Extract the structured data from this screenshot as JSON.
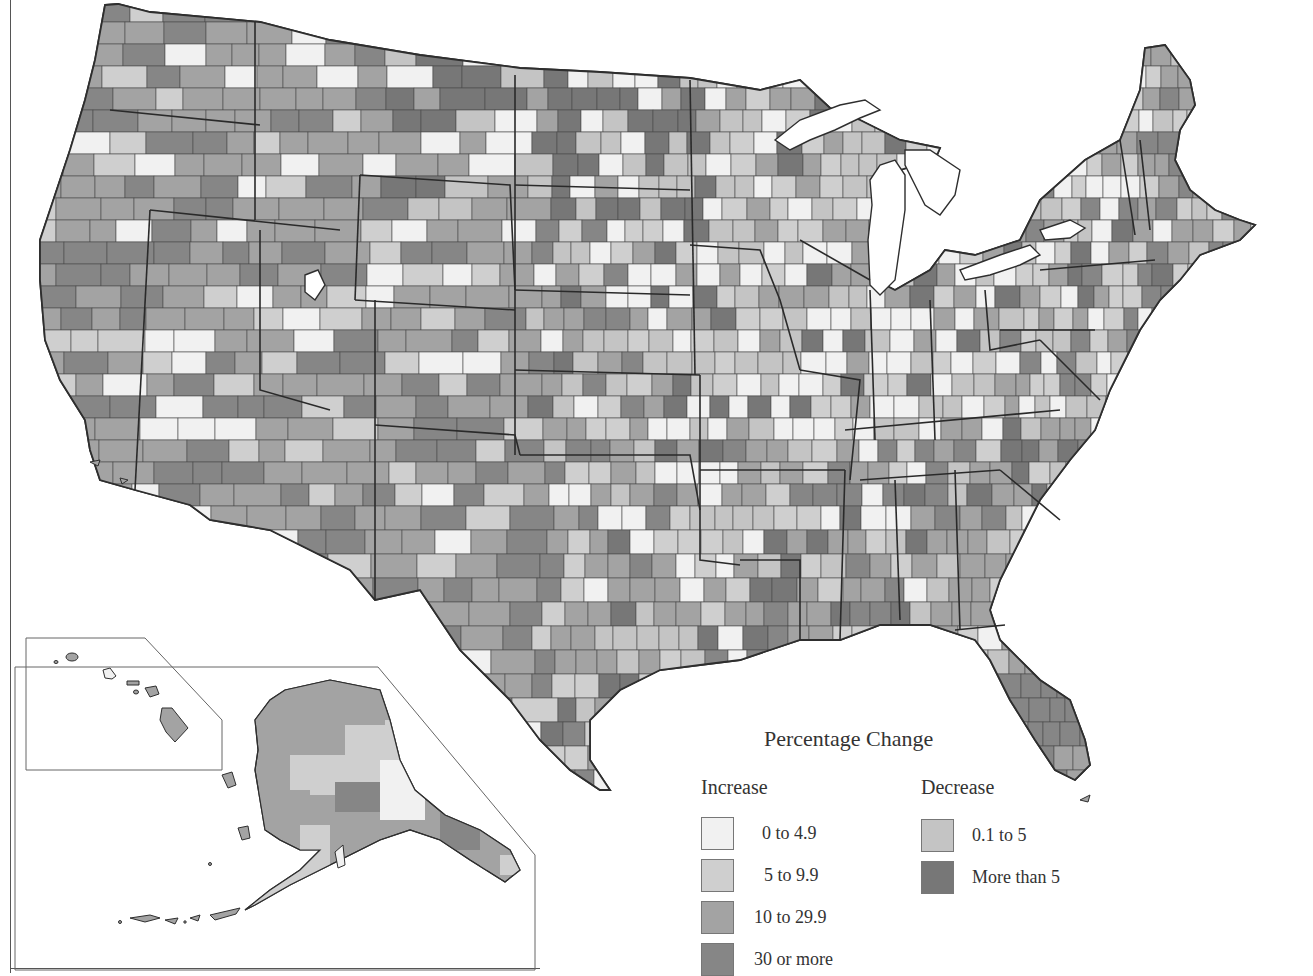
{
  "map": {
    "title": "Percentage Change",
    "subject": "County population percentage change, United States",
    "insets": [
      "Alaska",
      "Hawaii"
    ],
    "colors": {
      "inc_0_4_9": "#f1f1f1",
      "inc_5_9_9": "#cfcfcf",
      "inc_10_29_9": "#a3a3a3",
      "inc_30_plus": "#868686",
      "dec_0_1_5": "#c4c4c4",
      "dec_more_5": "#777777",
      "border": "#3a3a3a",
      "water": "#ffffff"
    }
  },
  "legend": {
    "title": "Percentage Change",
    "increase": {
      "heading": "Increase",
      "items": [
        {
          "label": "0 to 4.9",
          "color": "#f1f1f1"
        },
        {
          "label": "5 to 9.9",
          "color": "#cfcfcf"
        },
        {
          "label": "10 to 29.9",
          "color": "#a3a3a3"
        },
        {
          "label": "30 or more",
          "color": "#868686"
        }
      ]
    },
    "decrease": {
      "heading": "Decrease",
      "items": [
        {
          "label": "0.1 to 5",
          "color": "#c4c4c4"
        },
        {
          "label": "More than 5",
          "color": "#777777"
        }
      ]
    }
  }
}
